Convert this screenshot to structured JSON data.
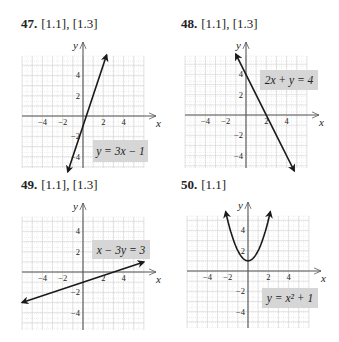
{
  "exercises": [
    {
      "number": "47.",
      "refs": "[1.1], [1.3]"
    },
    {
      "number": "48.",
      "refs": "[1.1], [1.3]"
    },
    {
      "number": "49.",
      "refs": "[1.1], [1.3]"
    },
    {
      "number": "50.",
      "refs": "[1.1]"
    }
  ],
  "colors": {
    "grid": "#d4d4d4",
    "grid_minor": "#e6e6e6",
    "axis": "#555555",
    "curve": "#1a1a1a",
    "label_bg": "#d6d6d6",
    "text": "#222222"
  },
  "chart_data": [
    {
      "type": "line",
      "title": "47. [1.1], [1.3]",
      "equation": "y = 3x − 1",
      "function": "3x-1",
      "xlabel": "x",
      "ylabel": "y",
      "xlim": [
        -6,
        6
      ],
      "ylim": [
        -5.5,
        6
      ],
      "x_ticks": [
        -4,
        -2,
        2,
        4
      ],
      "y_ticks": [
        4,
        2,
        -2,
        -4
      ],
      "grid": true,
      "points": [
        [
          -1.5,
          -5.5
        ],
        [
          2.33,
          6
        ]
      ]
    },
    {
      "type": "line",
      "title": "48. [1.1], [1.3]",
      "equation": "2x + y = 4",
      "function": "4-2x",
      "xlabel": "x",
      "ylabel": "y",
      "xlim": [
        -6,
        6
      ],
      "ylim": [
        -5.5,
        6
      ],
      "x_ticks": [
        -4,
        -2,
        2,
        4
      ],
      "y_ticks": [
        4,
        2,
        -2,
        -4
      ],
      "grid": true,
      "points": [
        [
          -1,
          6
        ],
        [
          4.75,
          -5.5
        ]
      ]
    },
    {
      "type": "line",
      "title": "49. [1.1], [1.3]",
      "equation": "x − 3y = 3",
      "function": "(x-3)/3",
      "xlabel": "x",
      "ylabel": "y",
      "xlim": [
        -6,
        6
      ],
      "ylim": [
        -5.5,
        6
      ],
      "x_ticks": [
        -4,
        -2,
        2,
        4
      ],
      "y_ticks": [
        4,
        2,
        -2,
        -4
      ],
      "grid": true,
      "points": [
        [
          -6,
          -3
        ],
        [
          6,
          1
        ]
      ]
    },
    {
      "type": "line",
      "title": "50. [1.1]",
      "equation": "y = x² + 1",
      "function": "x^2+1",
      "xlabel": "x",
      "ylabel": "y",
      "xlim": [
        -6,
        6
      ],
      "ylim": [
        -5.5,
        6
      ],
      "x_ticks": [
        -4,
        -2,
        2,
        4
      ],
      "y_ticks": [
        4,
        2,
        -2,
        -4
      ],
      "grid": true,
      "points": [
        [
          -2.2,
          5.84
        ],
        [
          -1.5,
          3.25
        ],
        [
          -1,
          2
        ],
        [
          -0.5,
          1.25
        ],
        [
          0,
          1
        ],
        [
          0.5,
          1.25
        ],
        [
          1,
          2
        ],
        [
          1.5,
          3.25
        ],
        [
          2.2,
          5.84
        ]
      ]
    }
  ]
}
